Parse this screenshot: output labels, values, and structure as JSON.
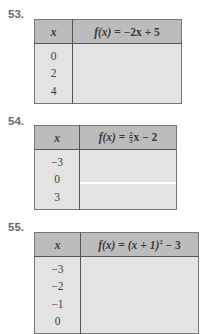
{
  "exercises": [
    {
      "number": "53.",
      "header_x": "x",
      "header_fx": "f(x) = −2x + 5",
      "fx_parts": {
        "lhs": "f(x)",
        "eq": " = ",
        "rhs": "−2x + 5"
      },
      "x_values": [
        "0",
        "2",
        "4"
      ],
      "fx_values": [
        "",
        "",
        ""
      ]
    },
    {
      "number": "54.",
      "header_x": "x",
      "header_fx": "f(x) = (2/3)x − 2",
      "fx_parts": {
        "lhs": "f(x)",
        "eq": " = ",
        "frac_num": "2",
        "frac_den": "3",
        "rhs": "x − 2"
      },
      "x_values": [
        "−3",
        "0",
        "3"
      ],
      "fx_values": [
        "",
        "",
        ""
      ]
    },
    {
      "number": "55.",
      "header_x": "x",
      "header_fx": "f(x) = (x + 1)^2 − 3",
      "fx_parts": {
        "lhs": "f(x)",
        "eq": " = ",
        "base": "(x + 1)",
        "exp": "2",
        "rhs": " − 3"
      },
      "x_values": [
        "−3",
        "−2",
        "−1",
        "0"
      ],
      "fx_values": [
        "",
        "",
        "",
        ""
      ]
    }
  ],
  "colors": {
    "header_bg": "#bcbcbc",
    "body_bg": "#e3e3e3",
    "border": "#555555",
    "number_text": "#6a6a6a"
  }
}
